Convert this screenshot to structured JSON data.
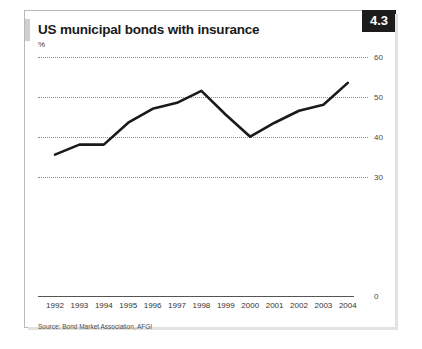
{
  "card": {
    "title": "US municipal bonds with insurance",
    "unit_label": "%",
    "badge": "4.3",
    "source": "Source: Bond Market Association, AFGI"
  },
  "chart_data": {
    "type": "line",
    "title": "US municipal bonds with insurance",
    "xlabel": "",
    "ylabel": "%",
    "ylim": [
      0,
      60
    ],
    "grid": true,
    "legend": "none",
    "yticks": [
      60,
      50,
      40,
      30,
      0
    ],
    "ytick_labels": [
      "60",
      "50",
      "40",
      "30",
      "0"
    ],
    "categories": [
      "1992",
      "1993",
      "1994",
      "1995",
      "1996",
      "1997",
      "1998",
      "1999",
      "2000",
      "2001",
      "2002",
      "2003",
      "2004"
    ],
    "series": [
      {
        "name": "US municipal bonds with insurance",
        "color": "#1a1a1a",
        "values": [
          35.5,
          38.0,
          38.0,
          43.5,
          47.0,
          48.5,
          51.5,
          45.5,
          40.0,
          43.5,
          46.5,
          48.0,
          53.5
        ]
      }
    ]
  },
  "colors": {
    "line": "#1a1a1a",
    "badge_bg": "#1c1c1c",
    "badge_text": "#ffffff",
    "grid": "#8e8e8e",
    "axis": "#555555",
    "card_border": "#b9b9b9"
  }
}
